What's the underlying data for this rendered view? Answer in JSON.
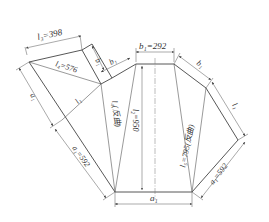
{
  "diagram": {
    "type": "sheet-metal unfolding / development layout",
    "labels": {
      "l3": "l₃=398",
      "l4": "l₄=576",
      "b1_top": "b₁=292",
      "b1_left": "b₁",
      "b1_left_inner": "b₁",
      "b1_right": "b₁",
      "l1_left": "l₁",
      "l1_right": "l₁",
      "a1_left": "a₁",
      "a1_left_dim": "a₁=592",
      "a1_right_dim": "a₁=592",
      "a1_bottom": "a₁",
      "l2": "l₂=950",
      "l4_bend": "l₄(反曲)",
      "l5_bend": "l₅=795(反曲)"
    },
    "values": {
      "l3": 398,
      "l4": 576,
      "b1": 292,
      "a1": 592,
      "l2": 950,
      "l5": 795
    },
    "colors": {
      "line": "#444444",
      "text": "#333333",
      "background": "#ffffff"
    }
  }
}
